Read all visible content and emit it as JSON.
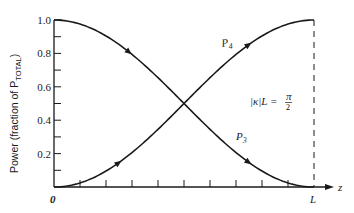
{
  "chart_data": {
    "type": "line",
    "title": "",
    "xlabel": "z",
    "ylabel": "Power (fraction of P_TOTAL)",
    "ylabel_main": "Power (fraction of P",
    "ylabel_sub": "TOTAL",
    "ylabel_end": ")",
    "x_ticks": [
      "0",
      "L"
    ],
    "y_ticks": [
      "0.2",
      "0.4",
      "0.6",
      "0.8",
      "1.0"
    ],
    "ylim": [
      0,
      1.0
    ],
    "xlim": [
      0,
      1
    ],
    "x_minor_divisions": 10,
    "y_minor_divisions": 10,
    "grid": false,
    "annotation": "|κ|L = π/2",
    "annotation_lhs": "|κ|L =",
    "annotation_num": "π",
    "annotation_den": "2",
    "series": [
      {
        "name": "P4",
        "label_main": "P",
        "label_sub": "4",
        "formula": "sin^2(πz/2L)",
        "direction": "increasing",
        "x": [
          0,
          0.1,
          0.2,
          0.3,
          0.4,
          0.5,
          0.6,
          0.7,
          0.8,
          0.9,
          1.0
        ],
        "values": [
          0,
          0.024,
          0.095,
          0.206,
          0.345,
          0.5,
          0.655,
          0.794,
          0.905,
          0.976,
          1.0
        ]
      },
      {
        "name": "P3",
        "label_main": "P",
        "label_sub": "3",
        "formula": "cos^2(πz/2L)",
        "direction": "decreasing",
        "x": [
          0,
          0.1,
          0.2,
          0.3,
          0.4,
          0.5,
          0.6,
          0.7,
          0.8,
          0.9,
          1.0
        ],
        "values": [
          1.0,
          0.976,
          0.905,
          0.794,
          0.655,
          0.5,
          0.345,
          0.206,
          0.095,
          0.024,
          0
        ]
      }
    ],
    "vertical_dashed_line_at": "L"
  }
}
